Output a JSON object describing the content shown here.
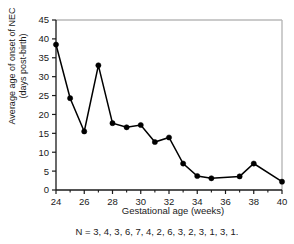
{
  "chart_data": {
    "type": "line",
    "title": "",
    "xlabel": "Gestational age (weeks)",
    "ylabel": "Average age of onset of NEC\n(days post-birth)",
    "ylabel_line1": "Average age of onset of NEC",
    "ylabel_line2": "(days post-birth)",
    "xlim": [
      24,
      40
    ],
    "ylim": [
      0,
      45
    ],
    "xticks": [
      24,
      26,
      28,
      30,
      32,
      34,
      36,
      38,
      40
    ],
    "xticks_minor": [
      25,
      27,
      29,
      31,
      33,
      35,
      37,
      39
    ],
    "yticks": [
      0,
      5,
      10,
      15,
      20,
      25,
      30,
      35,
      40,
      45
    ],
    "xtick_labels": [
      "24",
      "26",
      "28",
      "30",
      "32",
      "34",
      "36",
      "38",
      "40"
    ],
    "ytick_labels": [
      "0",
      "5",
      "10",
      "15",
      "20",
      "25",
      "30",
      "35",
      "40",
      "45"
    ],
    "grid": false,
    "legend": "none",
    "marker": "filled-circle",
    "line_color": "#000000",
    "marker_color": "#000000",
    "frame_color": "#b0b0b0",
    "axis_color": "#1a1a1a",
    "x": [
      24,
      25,
      26,
      27,
      28,
      29,
      30,
      31,
      32,
      33,
      34,
      35,
      37,
      38,
      40
    ],
    "values": [
      38.5,
      24.3,
      15.5,
      33.0,
      17.7,
      16.6,
      17.2,
      12.7,
      13.9,
      7.0,
      3.7,
      3.1,
      3.6,
      7.0,
      2.2
    ],
    "series": [
      {
        "name": "Average age of onset of NEC",
        "x": [
          24,
          25,
          26,
          27,
          28,
          29,
          30,
          31,
          32,
          33,
          34,
          35,
          37,
          38,
          40
        ],
        "values": [
          38.5,
          24.3,
          15.5,
          33.0,
          17.7,
          16.6,
          17.2,
          12.7,
          13.9,
          7.0,
          3.7,
          3.1,
          3.6,
          7.0,
          2.2
        ]
      }
    ],
    "annotations": {
      "sample_sizes": "N = 3, 4, 3, 6, 7, 4, 2, 6, 3, 2, 3, 1, 3, 1.",
      "sample_size_values": [
        3,
        4,
        3,
        6,
        7,
        4,
        2,
        6,
        3,
        2,
        3,
        1,
        3,
        1
      ]
    }
  }
}
